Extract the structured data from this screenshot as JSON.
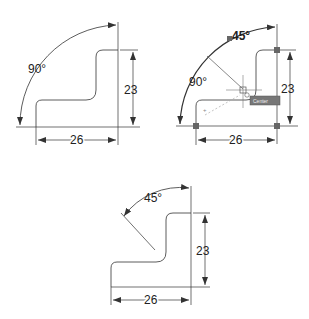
{
  "figures": [
    {
      "name": "original",
      "angle_label": "90°",
      "height_label": "23",
      "width_label": "26"
    },
    {
      "name": "editing",
      "angle_label_old": "90°",
      "angle_label_new": "45°",
      "height_label": "23",
      "width_label": "26",
      "tooltip": "Center"
    },
    {
      "name": "result",
      "angle_label": "45°",
      "height_label": "23",
      "width_label": "26"
    }
  ],
  "colors": {
    "line": "#333333",
    "grip": "#666666",
    "tooltip_bg": "#777777",
    "tooltip_text": "#eeeeee"
  }
}
